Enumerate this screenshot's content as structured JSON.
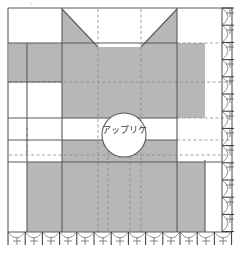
{
  "diagram": {
    "kind": "sewing-pattern",
    "title_mark": "·",
    "canvas": {
      "width": 239,
      "height": 253
    },
    "colors": {
      "fill_gray": "#b7b7b7",
      "outline": "#5a5a5a",
      "dashed_guide": "#8a8a8a",
      "background": "#ffffff",
      "tick_mark": "#4a4a4a",
      "label": "#3a3a3a"
    },
    "labels": [
      {
        "name": "applique-label",
        "text": "アップリケ",
        "x": 124,
        "y": 133
      }
    ],
    "circle": {
      "name": "applique-circle",
      "cx": 124,
      "cy": 135,
      "r": 22
    },
    "outer_frame": {
      "x": 8,
      "y": 8,
      "width": 224,
      "height": 226
    },
    "gray_regions": [
      {
        "name": "body-main",
        "points": "62,8 62,47 98,47 98,8"
      },
      {
        "name": "body-right-top",
        "points": "141,8 177,8 177,47 141,47"
      },
      {
        "name": "body-left-block",
        "points": "8,43 62,43 62,82 8,82"
      },
      {
        "name": "body-center",
        "points": "62,43 177,43 177,118 62,118"
      },
      {
        "name": "body-center-lower",
        "points": "62,140 177,140 177,162 62,162"
      },
      {
        "name": "body-bottom",
        "points": "27,162 205,162 205,232 27,232"
      },
      {
        "name": "body-center-col",
        "points": "62,118 177,118 177,140 62,140"
      }
    ],
    "triangles": [
      {
        "name": "notch-triangle-left",
        "points": "62,8 98,47 62,47"
      },
      {
        "name": "notch-triangle-right",
        "points": "177,8 177,47 141,47"
      }
    ],
    "solid_lines": [
      {
        "name": "frame-top",
        "x1": 8,
        "y1": 8,
        "x2": 232,
        "y2": 8
      },
      {
        "name": "frame-left",
        "x1": 8,
        "y1": 8,
        "x2": 8,
        "y2": 232
      },
      {
        "name": "frame-right",
        "x1": 232,
        "y1": 8,
        "x2": 232,
        "y2": 232
      },
      {
        "name": "frame-bottom",
        "x1": 8,
        "y1": 232,
        "x2": 232,
        "y2": 232
      },
      {
        "name": "edge-inner-right",
        "x1": 222,
        "y1": 8,
        "x2": 222,
        "y2": 232
      },
      {
        "name": "vert-left-major",
        "x1": 27,
        "y1": 43,
        "x2": 27,
        "y2": 232
      },
      {
        "name": "vert-body-left",
        "x1": 62,
        "y1": 8,
        "x2": 62,
        "y2": 232
      },
      {
        "name": "vert-body-right",
        "x1": 177,
        "y1": 8,
        "x2": 177,
        "y2": 232
      },
      {
        "name": "vert-right-block",
        "x1": 205,
        "y1": 162,
        "x2": 205,
        "y2": 232
      },
      {
        "name": "horiz-upper",
        "x1": 8,
        "y1": 43,
        "x2": 232,
        "y2": 43
      },
      {
        "name": "horiz-left-step",
        "x1": 8,
        "y1": 82,
        "x2": 62,
        "y2": 82
      },
      {
        "name": "horiz-gap-top",
        "x1": 8,
        "y1": 118,
        "x2": 177,
        "y2": 118
      },
      {
        "name": "horiz-gap-bottom",
        "x1": 8,
        "y1": 140,
        "x2": 177,
        "y2": 140
      },
      {
        "name": "horiz-lower",
        "x1": 8,
        "y1": 162,
        "x2": 232,
        "y2": 162
      }
    ],
    "dashed_lines": [
      {
        "name": "guide-v-1",
        "x1": 98,
        "y1": 8,
        "x2": 98,
        "y2": 232
      },
      {
        "name": "guide-v-2",
        "x1": 141,
        "y1": 8,
        "x2": 141,
        "y2": 232
      },
      {
        "name": "guide-v-3",
        "x1": 108,
        "y1": 140,
        "x2": 108,
        "y2": 232
      },
      {
        "name": "guide-v-4",
        "x1": 130,
        "y1": 140,
        "x2": 130,
        "y2": 232
      },
      {
        "name": "guide-v-left",
        "x1": 27,
        "y1": 130,
        "x2": 27,
        "y2": 155
      },
      {
        "name": "guide-h-1",
        "x1": 8,
        "y1": 82,
        "x2": 232,
        "y2": 82
      },
      {
        "name": "guide-h-2",
        "x1": 8,
        "y1": 43,
        "x2": 232,
        "y2": 43
      },
      {
        "name": "guide-h-3",
        "x1": 8,
        "y1": 118,
        "x2": 232,
        "y2": 118
      },
      {
        "name": "guide-h-4",
        "x1": 8,
        "y1": 140,
        "x2": 232,
        "y2": 140
      },
      {
        "name": "guide-h-5",
        "x1": 8,
        "y1": 155,
        "x2": 232,
        "y2": 155
      }
    ],
    "bottom_edge": {
      "name": "bottom-scallop-edge",
      "y_top": 232,
      "y_bottom": 246,
      "segment_count": 13,
      "x_start": 8,
      "x_end": 232
    },
    "right_edge": {
      "name": "right-scallop-edge",
      "x_left": 222,
      "x_right": 234,
      "segment_count": 13,
      "y_start": 8,
      "y_end": 232
    }
  }
}
